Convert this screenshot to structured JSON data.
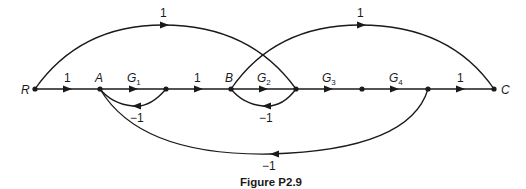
{
  "figure": {
    "caption": "Figure P2.9",
    "type": "signal-flow-graph"
  },
  "nodes": [
    {
      "id": "R",
      "label": "R",
      "x": 35,
      "y": 89
    },
    {
      "id": "A",
      "label": "A",
      "x": 100,
      "y": 89
    },
    {
      "id": "n3",
      "label": "",
      "x": 166,
      "y": 89
    },
    {
      "id": "B",
      "label": "B",
      "x": 231,
      "y": 89
    },
    {
      "id": "n5",
      "label": "",
      "x": 296,
      "y": 89
    },
    {
      "id": "n6",
      "label": "",
      "x": 362,
      "y": 89
    },
    {
      "id": "n7",
      "label": "",
      "x": 428,
      "y": 89
    },
    {
      "id": "C",
      "label": "C",
      "x": 494,
      "y": 89
    }
  ],
  "edges": [
    {
      "from": "R",
      "to": "A",
      "gain": "1",
      "kind": "forward"
    },
    {
      "from": "A",
      "to": "n3",
      "gain": "G",
      "sub": "1",
      "kind": "forward"
    },
    {
      "from": "n3",
      "to": "B",
      "gain": "1",
      "kind": "forward"
    },
    {
      "from": "B",
      "to": "n5",
      "gain": "G",
      "sub": "2",
      "kind": "forward"
    },
    {
      "from": "n5",
      "to": "n6",
      "gain": "G",
      "sub": "3",
      "kind": "forward"
    },
    {
      "from": "n6",
      "to": "n7",
      "gain": "G",
      "sub": "4",
      "kind": "forward"
    },
    {
      "from": "n7",
      "to": "C",
      "gain": "1",
      "kind": "forward"
    },
    {
      "from": "n3",
      "to": "A",
      "gain": "−1",
      "kind": "feedback-small"
    },
    {
      "from": "n5",
      "to": "B",
      "gain": "−1",
      "kind": "feedback-small"
    },
    {
      "from": "n7",
      "to": "A",
      "gain": "−1",
      "kind": "feedback-large"
    },
    {
      "from": "R",
      "to": "n5",
      "gain": "1",
      "kind": "feedforward-arc"
    },
    {
      "from": "B",
      "to": "C",
      "gain": "1",
      "kind": "feedforward-arc"
    }
  ],
  "labels": {
    "R": "R",
    "A": "A",
    "B": "B",
    "C": "C",
    "g1": "G",
    "g1_sub": "1",
    "g2": "G",
    "g2_sub": "2",
    "g3": "G",
    "g3_sub": "3",
    "g4": "G",
    "g4_sub": "4",
    "one_RA": "1",
    "one_n3B": "1",
    "one_n7C": "1",
    "one_arc1": "1",
    "one_arc2": "1",
    "neg_A": "−1",
    "neg_B": "−1",
    "neg_big": "−1"
  }
}
